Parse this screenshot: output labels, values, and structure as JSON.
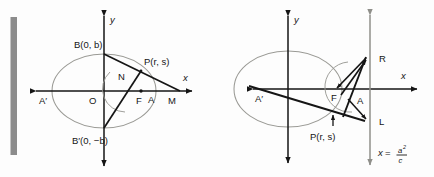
{
  "figure": {
    "background_color": "#fdfdfd",
    "ink_color": "#151515",
    "ellipse_color": "#9a9a95",
    "gray_bar_color": "#8c8c8c",
    "directrix_color": "#9a9a95"
  },
  "left_diagram": {
    "name": "ellipse-with-focal-chord",
    "axes": {
      "x_label": "x",
      "y_label": "y"
    },
    "points": [
      {
        "id": "B",
        "label": "B(0, b)",
        "role": "upper-minor-vertex"
      },
      {
        "id": "Bprime",
        "label": "B′(0, −b)",
        "role": "lower-minor-vertex"
      },
      {
        "id": "Aprime",
        "label": "A′",
        "role": "left-major-vertex"
      },
      {
        "id": "O",
        "label": "O",
        "role": "center"
      },
      {
        "id": "F",
        "label": "F",
        "role": "focus"
      },
      {
        "id": "A",
        "label": "A",
        "role": "right-major-vertex"
      },
      {
        "id": "M",
        "label": "M",
        "role": "point-on-x-axis"
      },
      {
        "id": "N",
        "label": "N",
        "role": "intersection-point"
      },
      {
        "id": "P",
        "label": "P(r, s)",
        "role": "point-on-ellipse"
      }
    ]
  },
  "right_diagram": {
    "name": "ellipse-with-directrix",
    "axes": {
      "x_label": "x",
      "y_label": "y"
    },
    "directrix": {
      "equation_lhs": "x",
      "equation_eq": "=",
      "equation_numerator": "a",
      "equation_numerator_sup": "2",
      "equation_denominator": "c"
    },
    "points": [
      {
        "id": "Aprime",
        "label": "A′",
        "role": "left-major-vertex"
      },
      {
        "id": "F",
        "label": "F",
        "role": "focus"
      },
      {
        "id": "A",
        "label": "A",
        "role": "right-major-vertex"
      },
      {
        "id": "R",
        "label": "R",
        "role": "upper-directrix-point"
      },
      {
        "id": "L",
        "label": "L",
        "role": "lower-directrix-point"
      },
      {
        "id": "P",
        "label": "P(r, s)",
        "role": "point-on-ellipse"
      }
    ]
  }
}
